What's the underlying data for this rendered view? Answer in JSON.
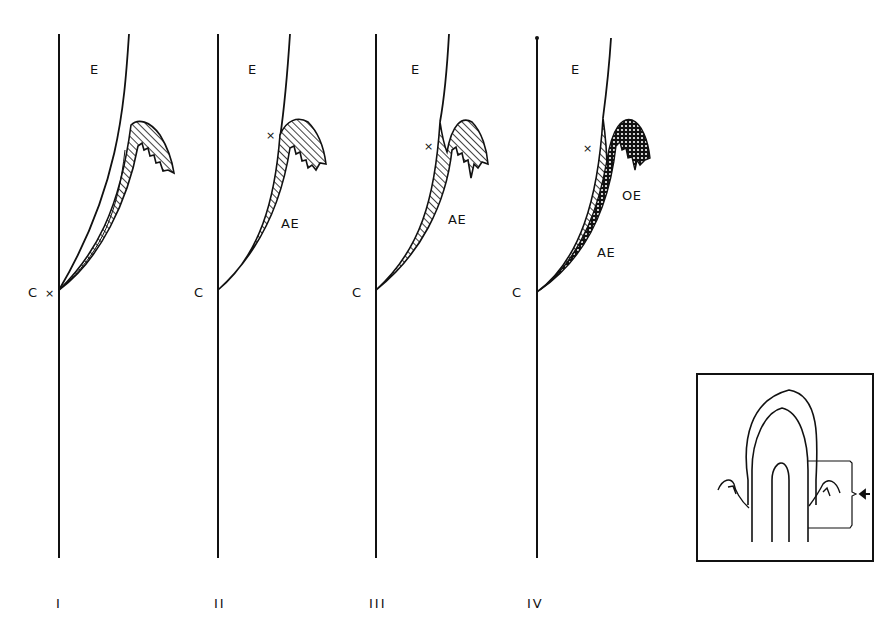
{
  "figure": {
    "panels": [
      {
        "id": "I",
        "numeral": "I",
        "labels": {
          "enamel": "E",
          "cervical": "C",
          "marker": "×"
        }
      },
      {
        "id": "II",
        "numeral": "II",
        "labels": {
          "enamel": "E",
          "cervical": "C",
          "marker": "×",
          "attached_epithelium": "AE"
        }
      },
      {
        "id": "III",
        "numeral": "III",
        "labels": {
          "enamel": "E",
          "cervical": "C",
          "marker": "×",
          "attached_epithelium": "AE"
        }
      },
      {
        "id": "IV",
        "numeral": "IV",
        "labels": {
          "enamel": "E",
          "cervical": "C",
          "marker": "×",
          "attached_epithelium": "AE",
          "oral_epithelium": "OE"
        }
      }
    ],
    "inset": {
      "description": "tooth-outline-with-gingiva",
      "indicator": "arrow-pointing-left-to-bracket"
    },
    "colors": {
      "line": "#111111",
      "background": "#ffffff"
    }
  }
}
